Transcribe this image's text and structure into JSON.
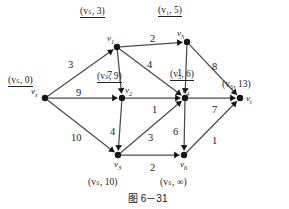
{
  "figure": {
    "caption": "图 6－31",
    "nodes": [
      {
        "id": "vs",
        "name": "v",
        "sub": "s",
        "x": 45,
        "y": 98,
        "tag": "(vₛ, 0)",
        "tag_pos": "above-left",
        "tag_x": 8,
        "tag_y": 76
      },
      {
        "id": "v1",
        "name": "v",
        "sub": "1",
        "x": 117,
        "y": 47,
        "tag": "(vₛ, 3)",
        "tag_pos": "above",
        "tag_x": 80,
        "tag_y": 7
      },
      {
        "id": "v5",
        "name": "v",
        "sub": "5",
        "x": 187,
        "y": 42,
        "tag": "(v₁, 5)",
        "tag_pos": "above",
        "tag_x": 158,
        "tag_y": 6
      },
      {
        "id": "v2",
        "name": "v",
        "sub": "2",
        "x": 122,
        "y": 98,
        "tag": "(vₛ, 9)",
        "tag_pos": "above",
        "tag_x": 97,
        "tag_y": 72
      },
      {
        "id": "v4",
        "name": "v",
        "sub": "4",
        "x": 185,
        "y": 98,
        "tag": "(v₅, 6)",
        "tag_pos": "above",
        "tag_x": 170,
        "tag_y": 70
      },
      {
        "id": "v3",
        "name": "v",
        "sub": "3",
        "x": 118,
        "y": 155,
        "tag": "(vₛ, 10)",
        "tag_pos": "below",
        "tag_x": 88,
        "tag_y": 178
      },
      {
        "id": "v6",
        "name": "v",
        "sub": "6",
        "x": 184,
        "y": 155,
        "tag": "(vₛ, ∞)",
        "tag_pos": "below",
        "tag_x": 160,
        "tag_y": 178
      },
      {
        "id": "vt",
        "name": "v",
        "sub": "t",
        "x": 240,
        "y": 98,
        "tag": "(v₅, 13)",
        "tag_pos": "right",
        "tag_x": 222,
        "tag_y": 80
      }
    ],
    "edges": [
      {
        "from": "vs",
        "to": "v1",
        "weight": "3",
        "lx": 68,
        "ly": 60
      },
      {
        "from": "vs",
        "to": "v2",
        "weight": "9",
        "lx": 76,
        "ly": 88
      },
      {
        "from": "vs",
        "to": "v3",
        "weight": "10",
        "lx": 71,
        "ly": 133
      },
      {
        "from": "v1",
        "to": "v5",
        "weight": "2",
        "lx": 150,
        "ly": 34
      },
      {
        "from": "v1",
        "to": "v2",
        "weight": "7",
        "lx": 107,
        "ly": 70
      },
      {
        "from": "v1",
        "to": "v4",
        "weight": "4",
        "lx": 147,
        "ly": 60
      },
      {
        "from": "v5",
        "to": "v4",
        "weight": "1",
        "lx": 177,
        "ly": 68
      },
      {
        "from": "v5",
        "to": "vt",
        "weight": "8",
        "lx": 212,
        "ly": 62
      },
      {
        "from": "v2",
        "to": "v4",
        "weight": "1",
        "lx": 152,
        "ly": 105
      },
      {
        "from": "v2",
        "to": "v3",
        "weight": "4",
        "lx": 110,
        "ly": 127
      },
      {
        "from": "v3",
        "to": "v4",
        "weight": "3",
        "lx": 148,
        "ly": 133
      },
      {
        "from": "v3",
        "to": "v6",
        "weight": "2",
        "lx": 150,
        "ly": 163
      },
      {
        "from": "v4",
        "to": "vt",
        "weight": "7",
        "lx": 212,
        "ly": 105
      },
      {
        "from": "v4",
        "to": "v6",
        "weight": "6",
        "lx": 173,
        "ly": 127
      },
      {
        "from": "v6",
        "to": "vt",
        "weight": "1",
        "lx": 212,
        "ly": 136
      }
    ]
  }
}
